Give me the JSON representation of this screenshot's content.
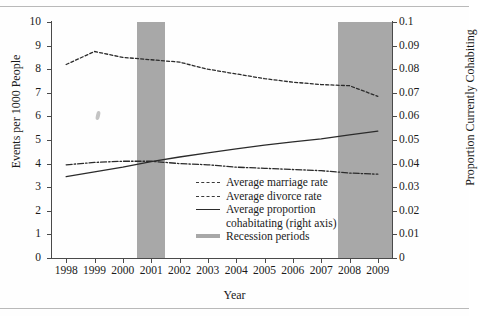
{
  "chart_data": {
    "type": "line",
    "title": "",
    "xlabel": "Year",
    "ylabel": "Events per 1000 People",
    "y2label": "Proportion Currently Cohabiting",
    "xlim": [
      1997.5,
      2009.5
    ],
    "ylim": [
      0,
      10
    ],
    "y2lim": [
      0,
      0.1
    ],
    "grid": false,
    "legend_position": "inside-center",
    "x_ticks": [
      "1998",
      "1999",
      "2000",
      "2001",
      "2002",
      "2003",
      "2004",
      "2005",
      "2006",
      "2007",
      "2008",
      "2009"
    ],
    "y_ticks": [
      "0",
      "1",
      "2",
      "3",
      "4",
      "5",
      "6",
      "7",
      "8",
      "9",
      "10"
    ],
    "y2_ticks": [
      "0",
      "0.01",
      "0.02",
      "0.03",
      "0.04",
      "0.05",
      "0.06",
      "0.07",
      "0.08",
      "0.09",
      "0.1"
    ],
    "x": [
      1998,
      1999,
      2000,
      2001,
      2002,
      2003,
      2004,
      2005,
      2006,
      2007,
      2008,
      2009
    ],
    "series": [
      {
        "name": "Average marriage rate",
        "style": "dashed",
        "axis": "left",
        "values": [
          8.2,
          8.75,
          8.5,
          8.4,
          8.3,
          8.0,
          7.8,
          7.6,
          7.45,
          7.35,
          7.3,
          6.85
        ]
      },
      {
        "name": "Average divorce rate",
        "style": "dash-dot",
        "axis": "left",
        "values": [
          3.95,
          4.05,
          4.1,
          4.1,
          4.0,
          3.95,
          3.85,
          3.8,
          3.75,
          3.7,
          3.6,
          3.55
        ]
      },
      {
        "name": "Average proportion cohabitating (right axis)",
        "style": "solid",
        "axis": "right",
        "values": [
          0.0345,
          0.0365,
          0.0385,
          0.0408,
          0.0428,
          0.0445,
          0.0462,
          0.0478,
          0.0492,
          0.0505,
          0.0522,
          0.0538
        ]
      }
    ],
    "shaded_regions": [
      {
        "name": "Recession periods",
        "x_start": 2000.5,
        "x_end": 2001.5,
        "color": "#a8a8a8"
      },
      {
        "name": "Recession periods",
        "x_start": 2007.6,
        "x_end": 2009.5,
        "color": "#a8a8a8"
      }
    ],
    "legend": [
      {
        "label": "Average marriage rate",
        "style": "dashed"
      },
      {
        "label": "Average divorce rate",
        "style": "dash-dot"
      },
      {
        "label": "Average proportion",
        "label2": "cohabitating (right axis)",
        "style": "solid"
      },
      {
        "label": "Recession periods",
        "style": "shaded-band"
      }
    ],
    "colors": {
      "line": "#2b2b2b",
      "recession_band": "#a8a8a8",
      "axis": "#4a4a4a",
      "background": "#fefefe"
    }
  }
}
